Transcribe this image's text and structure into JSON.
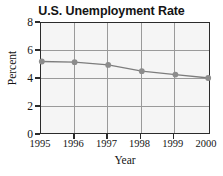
{
  "chart_data": {
    "type": "line",
    "title": "U.S. Unemployment Rate",
    "xlabel": "Year",
    "ylabel": "Percent",
    "categories": [
      "1995",
      "1996",
      "1997",
      "1998",
      "1999",
      "2000"
    ],
    "x": [
      1995,
      1996,
      1997,
      1998,
      1999,
      2000
    ],
    "values": [
      5.2,
      5.15,
      4.95,
      4.5,
      4.25,
      4.0
    ],
    "series": [
      {
        "name": "U.S. Unemployment Rate",
        "values": [
          5.2,
          5.15,
          4.95,
          4.5,
          4.25,
          4.0
        ]
      }
    ],
    "xlim": [
      1995,
      2000
    ],
    "ylim": [
      0,
      8
    ],
    "yticks": [
      0,
      2,
      4,
      6,
      8
    ],
    "ytick_labels": [
      "0",
      "2",
      "4",
      "6",
      "8"
    ],
    "xticks": [
      1995,
      1996,
      1997,
      1998,
      1999,
      2000
    ],
    "xtick_labels": [
      "1995",
      "1996",
      "1997",
      "1998",
      "1999",
      "2000"
    ],
    "grid": true,
    "legend": false,
    "marker": "circle",
    "colors": {
      "line": "#7d7d7d",
      "marker": "#8c8c8c",
      "gridline": "#9a9a9a",
      "axis": "#2b2b2b",
      "plot_background": "#f5f5f5",
      "figure_background": "#ffffff",
      "text": "#141414"
    }
  }
}
